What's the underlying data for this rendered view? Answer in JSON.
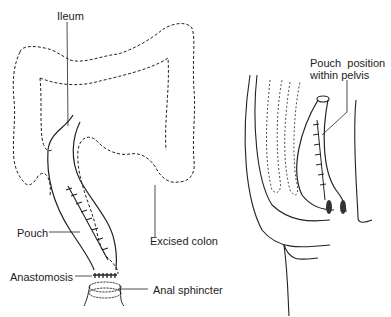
{
  "figure": {
    "left_panel": {
      "name": "ileal-pouch-overview",
      "labels": {
        "ileum": "Ileum",
        "pouch": "Pouch",
        "excised_colon": "Excised colon",
        "anastomosis": "Anastomosis",
        "anal_sphincter": "Anal sphincter"
      }
    },
    "right_panel": {
      "name": "pelvis-sagittal-view",
      "labels": {
        "pouch_position_line1": "Pouch  position",
        "pouch_position_line2": "within pelvis"
      }
    }
  }
}
